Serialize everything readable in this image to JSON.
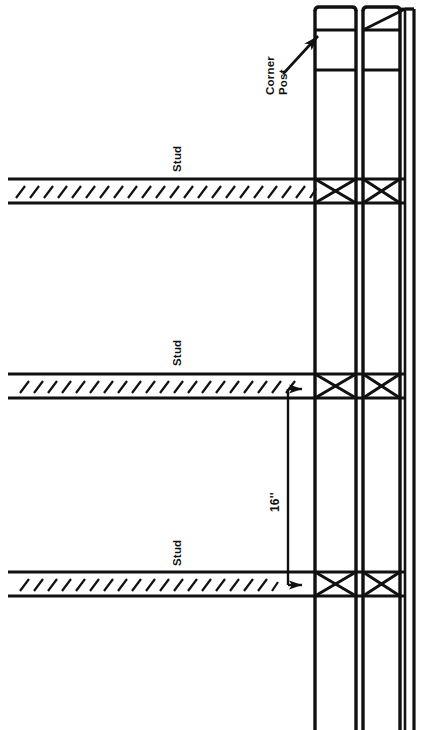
{
  "figure": {
    "type": "construction-detail-diagram",
    "orientation": "rotated-90-degrees",
    "background_color": "#ffffff",
    "line_color": "#111111"
  },
  "annotations": {
    "corner_post": {
      "label_line1": "Corner",
      "label_line2": "Post",
      "leader": "arrow pointing up-right to the left corner post"
    },
    "studs": [
      {
        "id": "stud-top",
        "label": "Stud"
      },
      {
        "id": "stud-middle",
        "label": "Stud"
      },
      {
        "id": "stud-bottom",
        "label": "Stud"
      }
    ],
    "dimension": {
      "value": "16",
      "unit_marks": "''",
      "label": "16''",
      "description": "on-center spacing between studs",
      "style": "bracket with arrowheads at both ends"
    }
  },
  "geometry": {
    "posts": [
      {
        "name": "left-corner-post",
        "x_left": 313,
        "x_right": 357
      },
      {
        "name": "right-corner-post",
        "x_left": 363,
        "x_right": 401
      },
      {
        "name": "outer-sheathing-line",
        "x_left": 405,
        "x_right": 414
      }
    ],
    "stud_rows": [
      {
        "name": "stud-top",
        "y_top": 177,
        "y_bottom": 205
      },
      {
        "name": "stud-middle",
        "y_top": 372,
        "y_bottom": 400
      },
      {
        "name": "stud-bottom",
        "y_top": 570,
        "y_bottom": 598
      }
    ],
    "x_braces": [
      {
        "post": "left-corner-post",
        "row": "stud-top"
      },
      {
        "post": "right-corner-post",
        "row": "stud-top"
      },
      {
        "post": "left-corner-post",
        "row": "stud-middle"
      },
      {
        "post": "right-corner-post",
        "row": "stud-middle"
      },
      {
        "post": "left-corner-post",
        "row": "stud-bottom"
      },
      {
        "post": "right-corner-post",
        "row": "stud-bottom"
      }
    ],
    "hatch": {
      "description": "diagonal tick hatching inside each stud band",
      "ticks_per_row": 24
    }
  }
}
